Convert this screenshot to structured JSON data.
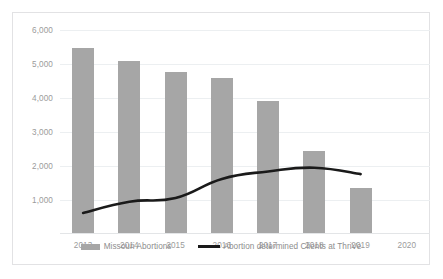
{
  "chart_data": {
    "type": "bar",
    "title": "",
    "subtitle": "",
    "xlabel": "",
    "ylabel": "",
    "categories": [
      "2013",
      "2014",
      "2015",
      "2016",
      "2017",
      "2018",
      "2019",
      "2020"
    ],
    "ylim": [
      0,
      6000
    ],
    "ytick_labels": [
      "6,000",
      "5,000",
      "4,000",
      "3,000",
      "2,000",
      "1,000",
      ""
    ],
    "ytick_values": [
      6000,
      5000,
      4000,
      3000,
      2000,
      1000,
      0
    ],
    "grid": true,
    "legend_position": "bottom",
    "series": [
      {
        "name": "Missouri Abortions",
        "type": "bar",
        "color": "#a6a6a6",
        "values": [
          5460,
          5100,
          4760,
          4580,
          3900,
          2450,
          1340,
          null
        ]
      },
      {
        "name": "Abortion determined Clients at ThriVe",
        "type": "line",
        "color": "#1a1a1a",
        "values": [
          620,
          950,
          1060,
          1620,
          1840,
          1950,
          1760,
          null
        ]
      }
    ]
  },
  "legend": {
    "entries": [
      {
        "label": "Missouri Abortions",
        "marker": "bar-swatch"
      },
      {
        "label": "Abortion determined Clients at ThriVe",
        "marker": "line-swatch"
      }
    ]
  },
  "colors": {
    "bar": "#a6a6a6",
    "line": "#1a1a1a",
    "gridline": "#eceff1",
    "axis_text": "#9b9b9b",
    "frame_border": "#e2e2e4",
    "background": "#ffffff"
  }
}
